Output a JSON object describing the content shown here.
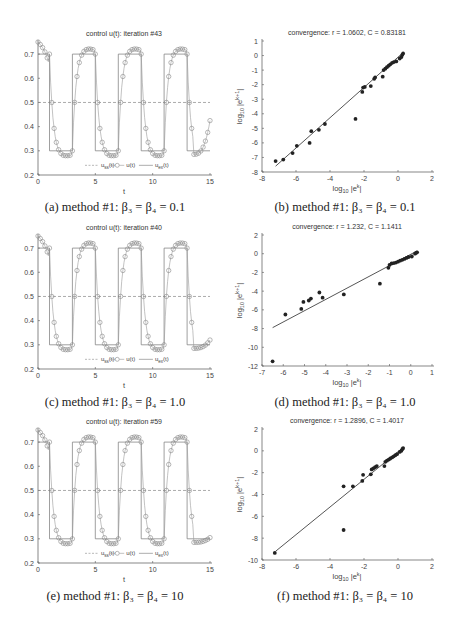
{
  "figure": {
    "panels": [
      {
        "id": "a",
        "caption": "(a) method #1: β₃ = β₄ = 0.1"
      },
      {
        "id": "b",
        "caption": "(b) method #1: β₃ = β₄ = 0.1"
      },
      {
        "id": "c",
        "caption": "(c) method #1: β₃ = β₄ = 1.0"
      },
      {
        "id": "d",
        "caption": "(d) method #1: β₃ = β₄ = 1.0"
      },
      {
        "id": "e",
        "caption": "(e) method #1: β₃ = β₄ = 10"
      },
      {
        "id": "f",
        "caption": "(f) method #1: β₃ = β₄ = 10"
      }
    ]
  },
  "chart_data": [
    {
      "id": "a",
      "type": "line",
      "title": "control u(t): iteration #43",
      "xlabel": "t",
      "ylabel": "",
      "xlim": [
        0,
        15
      ],
      "ylim": [
        0.2,
        0.75
      ],
      "xticks": [
        0,
        5,
        10,
        15
      ],
      "yticks": [
        0.2,
        0.3,
        0.4,
        0.5,
        0.6,
        0.7
      ],
      "legend": [
        "u_ss(t)",
        "u(t)",
        "u_ex(t)"
      ],
      "legend_position": "bottom-center inside",
      "series": [
        {
          "name": "u_ss(t)",
          "style": "dashed",
          "x": [
            0,
            15
          ],
          "y": [
            0.5,
            0.5
          ]
        },
        {
          "name": "u_ex(t)",
          "style": "solid-step",
          "x": [
            0,
            1,
            1,
            3,
            3,
            5,
            5,
            7,
            7,
            9,
            9,
            11,
            11,
            13,
            13,
            15
          ],
          "y": [
            0.7,
            0.7,
            0.3,
            0.3,
            0.7,
            0.7,
            0.3,
            0.3,
            0.7,
            0.7,
            0.3,
            0.3,
            0.7,
            0.7,
            0.3,
            0.3
          ]
        },
        {
          "name": "u(t)",
          "style": "circles",
          "end_value": 0.425
        }
      ]
    },
    {
      "id": "b",
      "type": "scatter",
      "title": "convergence: r = 1.0602, C = 0.83181",
      "xlabel": "log10 |e^k|",
      "ylabel": "log10 |e^(k+1)|",
      "xlim": [
        -8,
        2
      ],
      "ylim": [
        -8,
        1
      ],
      "xticks": [
        -8,
        -6,
        -4,
        -2,
        0,
        2
      ],
      "yticks": [
        -8,
        -7,
        -6,
        -5,
        -4,
        -3,
        -2,
        -1,
        0,
        1
      ],
      "fit_line": {
        "x": [
          -7.2,
          0.3
        ],
        "y": [
          -7.6,
          0.2
        ]
      },
      "points": [
        [
          -7.2,
          -7.25
        ],
        [
          -6.75,
          -7.15
        ],
        [
          -6.2,
          -6.7
        ],
        [
          -5.95,
          -6.2
        ],
        [
          -5.2,
          -6.0
        ],
        [
          -5.1,
          -5.2
        ],
        [
          -4.65,
          -5.1
        ],
        [
          -4.3,
          -4.7
        ],
        [
          -2.5,
          -4.35
        ],
        [
          -2.1,
          -2.5
        ],
        [
          -2.05,
          -2.2
        ],
        [
          -1.95,
          -2.15
        ],
        [
          -1.6,
          -2.1
        ],
        [
          -1.4,
          -1.6
        ],
        [
          -1.35,
          -1.5
        ],
        [
          -0.9,
          -1.45
        ],
        [
          -0.85,
          -1.0
        ],
        [
          -0.75,
          -0.9
        ],
        [
          -0.65,
          -0.8
        ],
        [
          -0.55,
          -0.7
        ],
        [
          -0.45,
          -0.6
        ],
        [
          -0.35,
          -0.5
        ],
        [
          -0.25,
          -0.45
        ],
        [
          -0.1,
          -0.4
        ],
        [
          0.1,
          -0.2
        ],
        [
          0.2,
          -0.1
        ],
        [
          0.25,
          0.05
        ],
        [
          0.3,
          0.15
        ]
      ]
    },
    {
      "id": "c",
      "type": "line",
      "title": "control u(t): iteration #40",
      "xlabel": "t",
      "ylabel": "",
      "xlim": [
        0,
        15
      ],
      "ylim": [
        0.2,
        0.75
      ],
      "xticks": [
        0,
        5,
        10,
        15
      ],
      "yticks": [
        0.2,
        0.3,
        0.4,
        0.5,
        0.6,
        0.7
      ],
      "legend": [
        "u_ss(t)",
        "u(t)",
        "u_ex(t)"
      ],
      "series": [
        {
          "name": "u_ss(t)",
          "style": "dashed",
          "x": [
            0,
            15
          ],
          "y": [
            0.5,
            0.5
          ]
        },
        {
          "name": "u_ex(t)",
          "style": "solid-step"
        },
        {
          "name": "u(t)",
          "style": "circles",
          "end_value": 0.32
        }
      ]
    },
    {
      "id": "d",
      "type": "scatter",
      "title": "convergence: r = 1.232, C = 1.1411",
      "xlabel": "log10 |e^k|",
      "ylabel": "log10 |e^(k+1)|",
      "xlim": [
        -7,
        1
      ],
      "ylim": [
        -12,
        2
      ],
      "xticks": [
        -7,
        -6,
        -5,
        -4,
        -3,
        -2,
        -1,
        0,
        1
      ],
      "yticks": [
        -12,
        -10,
        -8,
        -6,
        -4,
        -2,
        0,
        2
      ],
      "fit_line": {
        "x": [
          -6.5,
          0.3
        ],
        "y": [
          -7.9,
          0.3
        ]
      },
      "points": [
        [
          -6.5,
          -11.5
        ],
        [
          -5.9,
          -6.5
        ],
        [
          -5.15,
          -5.9
        ],
        [
          -5.05,
          -5.15
        ],
        [
          -4.8,
          -5.0
        ],
        [
          -4.7,
          -4.8
        ],
        [
          -4.3,
          -4.15
        ],
        [
          -4.15,
          -4.7
        ],
        [
          -3.15,
          -4.35
        ],
        [
          -1.45,
          -3.2
        ],
        [
          -1.05,
          -1.5
        ],
        [
          -1.0,
          -1.2
        ],
        [
          -0.9,
          -1.05
        ],
        [
          -0.8,
          -1.0
        ],
        [
          -0.7,
          -0.95
        ],
        [
          -0.6,
          -0.85
        ],
        [
          -0.5,
          -0.75
        ],
        [
          -0.4,
          -0.65
        ],
        [
          -0.3,
          -0.55
        ],
        [
          -0.2,
          -0.45
        ],
        [
          -0.1,
          -0.35
        ],
        [
          0.05,
          -0.3
        ],
        [
          0.2,
          0.0
        ],
        [
          0.25,
          0.1
        ],
        [
          0.3,
          0.15
        ]
      ]
    },
    {
      "id": "e",
      "type": "line",
      "title": "control u(t): iteration #59",
      "xlabel": "t",
      "ylabel": "",
      "xlim": [
        0,
        15
      ],
      "ylim": [
        0.2,
        0.75
      ],
      "xticks": [
        0,
        5,
        10,
        15
      ],
      "yticks": [
        0.2,
        0.3,
        0.4,
        0.5,
        0.6,
        0.7
      ],
      "legend": [
        "u_ss(t)",
        "u(t)",
        "u_ex(t)"
      ],
      "series": [
        {
          "name": "u_ss(t)",
          "style": "dashed",
          "x": [
            0,
            15
          ],
          "y": [
            0.5,
            0.5
          ]
        },
        {
          "name": "u_ex(t)",
          "style": "solid-step"
        },
        {
          "name": "u(t)",
          "style": "circles",
          "end_value": 0.305
        }
      ]
    },
    {
      "id": "f",
      "type": "scatter",
      "title": "convergence: r = 1.2896, C = 1.4017",
      "xlabel": "log10 |e^k|",
      "ylabel": "log10 |e^(k+1)|",
      "xlim": [
        -8,
        2
      ],
      "ylim": [
        -10,
        2
      ],
      "xticks": [
        -8,
        -6,
        -4,
        -2,
        0,
        2
      ],
      "yticks": [
        -10,
        -8,
        -6,
        -4,
        -2,
        0,
        2
      ],
      "fit_line": {
        "x": [
          -7.2,
          0.3
        ],
        "y": [
          -9.2,
          0.3
        ]
      },
      "points": [
        [
          -7.25,
          -9.35
        ],
        [
          -3.2,
          -3.25
        ],
        [
          -3.2,
          -7.25
        ],
        [
          -2.65,
          -3.25
        ],
        [
          -2.1,
          -2.75
        ],
        [
          -2.05,
          -2.2
        ],
        [
          -1.6,
          -2.15
        ],
        [
          -1.55,
          -1.7
        ],
        [
          -1.45,
          -1.6
        ],
        [
          -1.35,
          -1.5
        ],
        [
          -1.25,
          -1.4
        ],
        [
          -0.8,
          -1.4
        ],
        [
          -0.75,
          -1.0
        ],
        [
          -0.65,
          -0.9
        ],
        [
          -0.55,
          -0.8
        ],
        [
          -0.45,
          -0.7
        ],
        [
          -0.35,
          -0.6
        ],
        [
          -0.25,
          -0.5
        ],
        [
          -0.15,
          -0.4
        ],
        [
          -0.05,
          -0.3
        ],
        [
          0.1,
          -0.1
        ],
        [
          0.2,
          0.0
        ],
        [
          0.25,
          0.15
        ],
        [
          0.3,
          0.25
        ]
      ]
    }
  ]
}
